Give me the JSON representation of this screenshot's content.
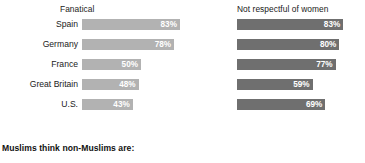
{
  "caption": "Muslims think non-Muslims are:",
  "chart_data": {
    "type": "bar",
    "orientation": "horizontal",
    "title": "",
    "subtitle": "",
    "annotation": "Muslims think non-Muslims are:",
    "xlabel": "",
    "ylabel": "",
    "xlim": [
      0,
      100
    ],
    "grid": false,
    "legend_position": "column-headers",
    "value_suffix": "%",
    "categories": [
      "Spain",
      "Germany",
      "France",
      "Great Britain",
      "U.S."
    ],
    "series": [
      {
        "name": "Fanatical",
        "color": "#b2b2b2",
        "values": [
          83,
          78,
          50,
          48,
          43
        ],
        "labels": [
          "83%",
          "78%",
          "50%",
          "48%",
          "43%"
        ]
      },
      {
        "name": "Not respectful of women",
        "color": "#6f6f6f",
        "values": [
          83,
          80,
          77,
          59,
          69
        ],
        "labels": [
          "83%",
          "80%",
          "77%",
          "59%",
          "69%"
        ]
      }
    ]
  }
}
